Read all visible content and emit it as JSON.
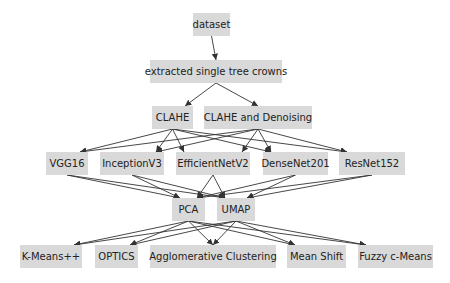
{
  "diagram": {
    "type": "flowchart",
    "node_color": "#d9d9d9",
    "edge_color": "#333333",
    "nodes": [
      {
        "id": "dataset",
        "label": "dataset",
        "x": 193,
        "y": 13,
        "w": 37,
        "h": 23
      },
      {
        "id": "extracted",
        "label": "extracted single tree crowns",
        "x": 150,
        "y": 60,
        "w": 132,
        "h": 23
      },
      {
        "id": "clahe",
        "label": "CLAHE",
        "x": 152,
        "y": 106,
        "w": 41,
        "h": 23
      },
      {
        "id": "clahe_dn",
        "label": "CLAHE and Denoising",
        "x": 204,
        "y": 106,
        "w": 108,
        "h": 23
      },
      {
        "id": "vgg16",
        "label": "VGG16",
        "x": 46,
        "y": 152,
        "w": 42,
        "h": 23
      },
      {
        "id": "inceptionv3",
        "label": "InceptionV3",
        "x": 100,
        "y": 152,
        "w": 64,
        "h": 23
      },
      {
        "id": "efficientnetv2",
        "label": "EfficientNetV2",
        "x": 176,
        "y": 152,
        "w": 74,
        "h": 23
      },
      {
        "id": "densenet201",
        "label": "DenseNet201",
        "x": 263,
        "y": 152,
        "w": 65,
        "h": 23
      },
      {
        "id": "resnet152",
        "label": "ResNet152",
        "x": 339,
        "y": 152,
        "w": 66,
        "h": 23
      },
      {
        "id": "pca",
        "label": "PCA",
        "x": 172,
        "y": 198,
        "w": 33,
        "h": 23
      },
      {
        "id": "umap",
        "label": "UMAP",
        "x": 217,
        "y": 198,
        "w": 38,
        "h": 23
      },
      {
        "id": "kmeans",
        "label": "K-Means++",
        "x": 20,
        "y": 245,
        "w": 62,
        "h": 23
      },
      {
        "id": "optics",
        "label": "OPTICS",
        "x": 95,
        "y": 245,
        "w": 43,
        "h": 23
      },
      {
        "id": "agglo",
        "label": "Agglomerative Clustering",
        "x": 150,
        "y": 245,
        "w": 126,
        "h": 23
      },
      {
        "id": "meanshift",
        "label": "Mean Shift",
        "x": 287,
        "y": 245,
        "w": 59,
        "h": 23
      },
      {
        "id": "fuzzy",
        "label": "Fuzzy c-Means",
        "x": 358,
        "y": 245,
        "w": 75,
        "h": 23
      }
    ],
    "edges": [
      [
        "dataset",
        "extracted"
      ],
      [
        "extracted",
        "clahe"
      ],
      [
        "extracted",
        "clahe_dn"
      ],
      [
        "clahe",
        "vgg16"
      ],
      [
        "clahe",
        "inceptionv3"
      ],
      [
        "clahe",
        "efficientnetv2"
      ],
      [
        "clahe",
        "densenet201"
      ],
      [
        "clahe",
        "resnet152"
      ],
      [
        "clahe_dn",
        "vgg16"
      ],
      [
        "clahe_dn",
        "inceptionv3"
      ],
      [
        "clahe_dn",
        "efficientnetv2"
      ],
      [
        "clahe_dn",
        "densenet201"
      ],
      [
        "clahe_dn",
        "resnet152"
      ],
      [
        "vgg16",
        "pca"
      ],
      [
        "vgg16",
        "umap"
      ],
      [
        "inceptionv3",
        "pca"
      ],
      [
        "inceptionv3",
        "umap"
      ],
      [
        "efficientnetv2",
        "pca"
      ],
      [
        "efficientnetv2",
        "umap"
      ],
      [
        "densenet201",
        "pca"
      ],
      [
        "densenet201",
        "umap"
      ],
      [
        "resnet152",
        "pca"
      ],
      [
        "resnet152",
        "umap"
      ],
      [
        "pca",
        "kmeans"
      ],
      [
        "pca",
        "optics"
      ],
      [
        "pca",
        "agglo"
      ],
      [
        "pca",
        "meanshift"
      ],
      [
        "pca",
        "fuzzy"
      ],
      [
        "umap",
        "kmeans"
      ],
      [
        "umap",
        "optics"
      ],
      [
        "umap",
        "agglo"
      ],
      [
        "umap",
        "meanshift"
      ],
      [
        "umap",
        "fuzzy"
      ]
    ]
  }
}
